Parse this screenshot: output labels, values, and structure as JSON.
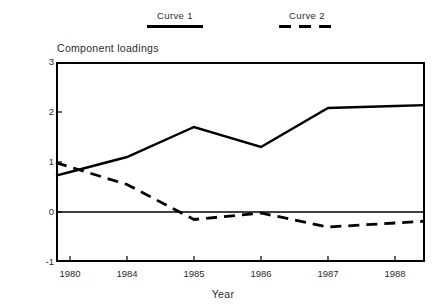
{
  "chart_data": {
    "type": "line",
    "title": "",
    "ylabel": "Component loadings",
    "xlabel": "Year",
    "categories": [
      "1980",
      "1984",
      "1985",
      "1986",
      "1987",
      "1988"
    ],
    "ylim": [
      -1,
      3
    ],
    "yticks": [
      "3",
      "2",
      "1",
      "0",
      "-1"
    ],
    "ytick_values": [
      3,
      2,
      1,
      0,
      -1
    ],
    "grid": false,
    "zero_line": true,
    "legend_position": "above-plot",
    "series": [
      {
        "name": "Curve 1",
        "style": "solid",
        "color": "#000000",
        "values": [
          0.8,
          1.1,
          1.7,
          1.3,
          2.08,
          2.12
        ]
      },
      {
        "name": "Curve 2",
        "style": "dashed",
        "color": "#000000",
        "values": [
          0.9,
          0.55,
          -0.15,
          -0.02,
          -0.3,
          -0.22
        ]
      }
    ]
  },
  "legend": {
    "entries": [
      {
        "label": "Curve 1",
        "style": "solid"
      },
      {
        "label": "Curve 2",
        "style": "dashed"
      }
    ]
  },
  "axes": {
    "y_title": "Component loadings",
    "x_title": "Year"
  }
}
